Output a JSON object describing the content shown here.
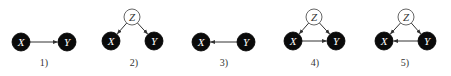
{
  "diagrams": [
    {
      "caption": "1)",
      "nodes": [
        {
          "id": "X",
          "label": "X",
          "type": "observed",
          "x": 21,
          "y": 42
        },
        {
          "id": "Y",
          "label": "Y",
          "type": "observed",
          "x": 67,
          "y": 42
        }
      ],
      "edges": [
        {
          "from": "X",
          "to": "Y"
        }
      ],
      "caption_pos": {
        "x": 44,
        "y": 66
      }
    },
    {
      "caption": "2)",
      "nodes": [
        {
          "id": "Z",
          "label": "Z",
          "type": "latent",
          "x": 132,
          "y": 17
        },
        {
          "id": "X",
          "label": "X",
          "type": "observed",
          "x": 111,
          "y": 41
        },
        {
          "id": "Y",
          "label": "Y",
          "type": "observed",
          "x": 154,
          "y": 41
        }
      ],
      "edges": [
        {
          "from": "Z",
          "to": "X"
        },
        {
          "from": "Z",
          "to": "Y"
        }
      ],
      "caption_pos": {
        "x": 134,
        "y": 66
      }
    },
    {
      "caption": "3)",
      "nodes": [
        {
          "id": "X",
          "label": "X",
          "type": "observed",
          "x": 201,
          "y": 42
        },
        {
          "id": "Y",
          "label": "Y",
          "type": "observed",
          "x": 246,
          "y": 42
        }
      ],
      "edges": [
        {
          "from": "Y",
          "to": "X"
        }
      ],
      "caption_pos": {
        "x": 224,
        "y": 66
      }
    },
    {
      "caption": "4)",
      "nodes": [
        {
          "id": "Z",
          "label": "Z",
          "type": "latent",
          "x": 314,
          "y": 17
        },
        {
          "id": "X",
          "label": "X",
          "type": "observed",
          "x": 293,
          "y": 41
        },
        {
          "id": "Y",
          "label": "Y",
          "type": "observed",
          "x": 336,
          "y": 41
        }
      ],
      "edges": [
        {
          "from": "Z",
          "to": "X"
        },
        {
          "from": "Z",
          "to": "Y"
        },
        {
          "from": "X",
          "to": "Y"
        }
      ],
      "caption_pos": {
        "x": 315,
        "y": 66
      }
    },
    {
      "caption": "5)",
      "nodes": [
        {
          "id": "Z",
          "label": "Z",
          "type": "latent",
          "x": 406,
          "y": 17
        },
        {
          "id": "X",
          "label": "X",
          "type": "observed",
          "x": 384,
          "y": 41
        },
        {
          "id": "Y",
          "label": "Y",
          "type": "observed",
          "x": 427,
          "y": 41
        }
      ],
      "edges": [
        {
          "from": "Z",
          "to": "X"
        },
        {
          "from": "Z",
          "to": "Y"
        },
        {
          "from": "Y",
          "to": "X"
        }
      ],
      "caption_pos": {
        "x": 405,
        "y": 66
      }
    }
  ],
  "style": {
    "observed_fill": "#0a0a0a",
    "observed_text": "#ffffff",
    "latent_fill": "#ffffff",
    "latent_stroke": "#555555",
    "edge_color": "#333333",
    "observed_radius": 9,
    "latent_radius": 8
  }
}
